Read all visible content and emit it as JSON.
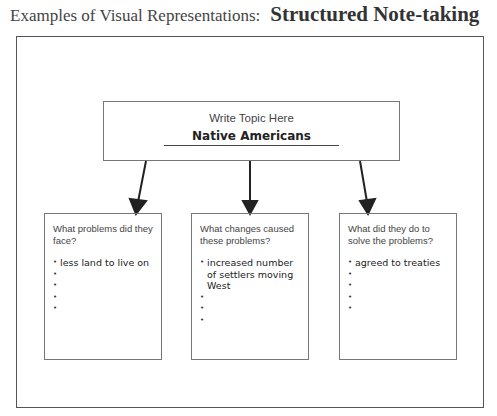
{
  "header": {
    "lead": "Examples of Visual Representations:",
    "title": "Structured Note-taking"
  },
  "topic": {
    "prompt": "Write Topic Here",
    "value": "Native Americans"
  },
  "boxes": [
    {
      "question": "What problems did they face?",
      "bullets": [
        "less land to live on",
        "",
        "",
        "",
        ""
      ]
    },
    {
      "question": "What changes caused these problems?",
      "bullets": [
        "increased number of settlers moving West",
        "",
        "",
        ""
      ]
    },
    {
      "question": "What did they do to solve the problems?",
      "bullets": [
        "agreed to treaties",
        "",
        "",
        "",
        ""
      ]
    }
  ]
}
